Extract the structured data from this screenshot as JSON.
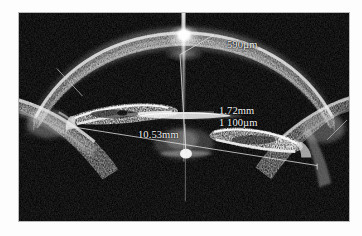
{
  "image": {
    "modality": "ultrasound-biomicroscopy",
    "subject": "anterior-segment-of-eye",
    "background_color": "#000000",
    "frame_color": "#b9b9b9",
    "page_background": "#ffffff",
    "annotation_color": "#f2f2f2",
    "width": 362,
    "height": 236
  },
  "measurements": [
    {
      "id": "corneal-thickness",
      "label": "590µm",
      "value": 590,
      "unit": "µm",
      "leader_line": true,
      "anchor": "corneal-apex"
    },
    {
      "id": "anterior-chamber-depth",
      "label": "1.72mm",
      "value": 1.72,
      "unit": "mm",
      "leader_line": true,
      "anchor": "cornea-to-lens-vertical-caliper"
    },
    {
      "id": "lens-vault",
      "label": "1 100µm",
      "value": 1100,
      "unit": "µm",
      "leader_line": true,
      "anchor": "lens-anterior-surface-horizontal"
    },
    {
      "id": "sulcus-to-sulcus-diameter",
      "label": "10.53mm",
      "value": 10.53,
      "unit": "mm",
      "leader_line": true,
      "anchor": "angle-to-angle-diagonal-caliper"
    }
  ],
  "structures": [
    {
      "id": "cornea",
      "name": "cornea"
    },
    {
      "id": "iris-left",
      "name": "iris-left"
    },
    {
      "id": "iris-right",
      "name": "iris-right"
    },
    {
      "id": "lens",
      "name": "crystalline-lens"
    },
    {
      "id": "sclera-left",
      "name": "sclera-left"
    },
    {
      "id": "sclera-right",
      "name": "sclera-right"
    },
    {
      "id": "apex-artifact",
      "name": "specular-reflection-artifact"
    }
  ]
}
